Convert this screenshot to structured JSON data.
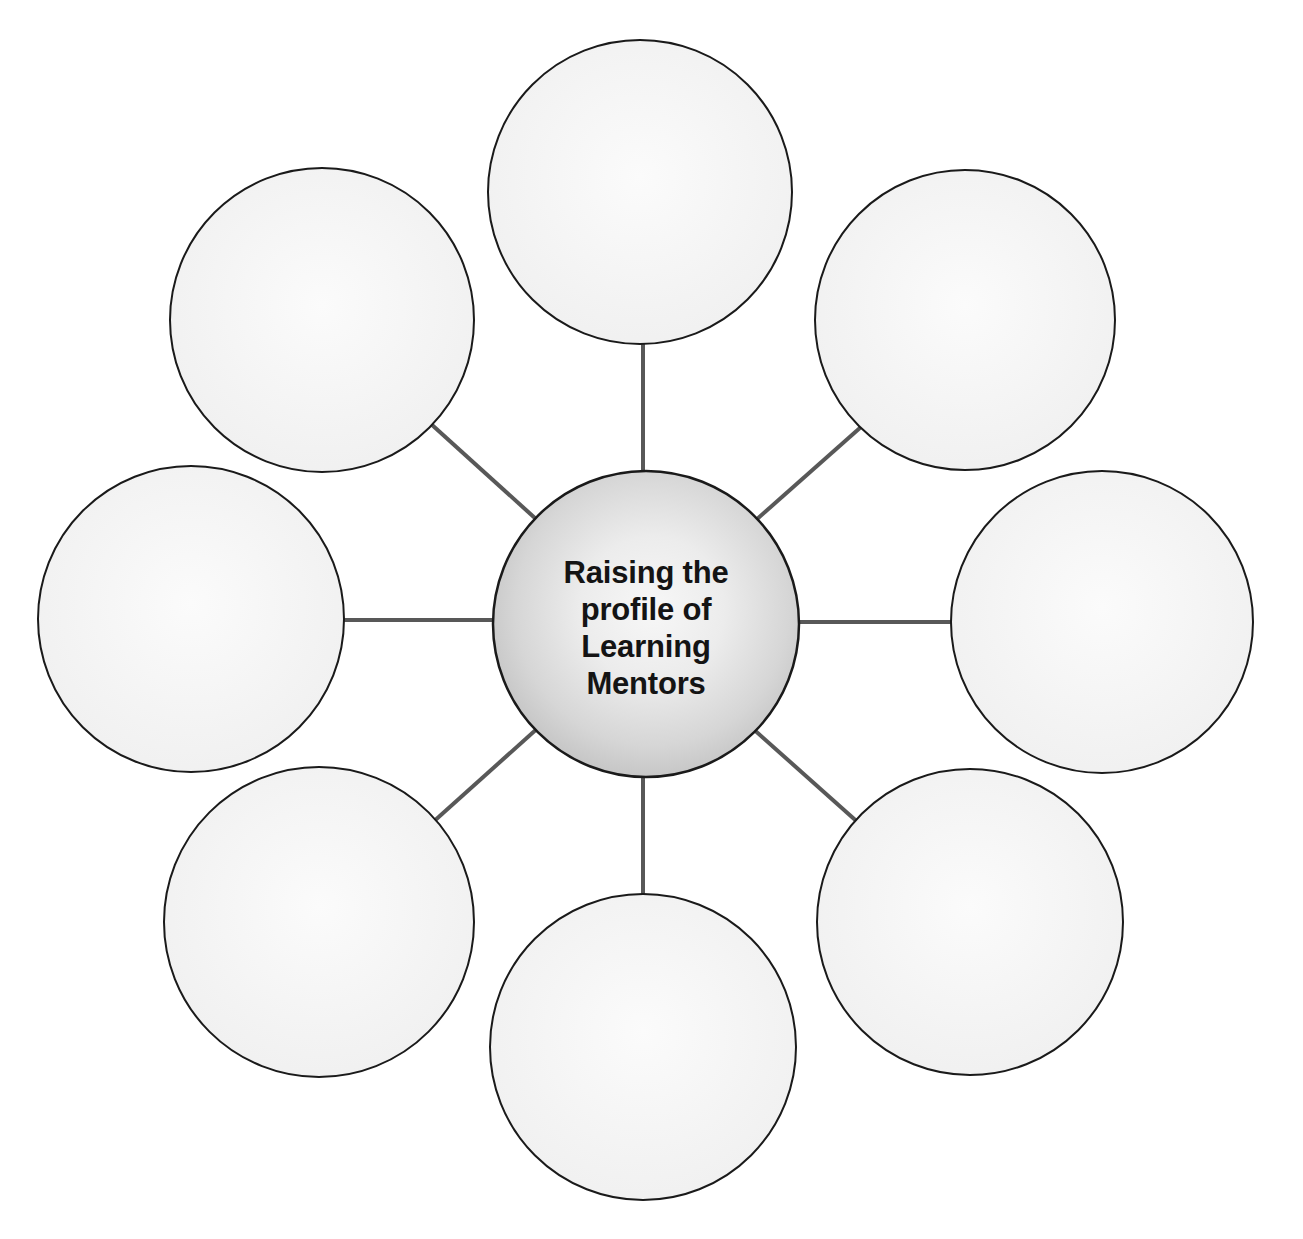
{
  "document": {
    "type": "spider-web-graphic-organizer",
    "title": "Raising the profile of Learning Mentors",
    "background_color": "#ffffff"
  },
  "center_node": {
    "id": "center",
    "label_lines": [
      "Raising the",
      "profile of",
      "Learning",
      "Mentors"
    ],
    "label_full": "Raising the profile of Learning Mentors",
    "cx": 646,
    "cy": 624,
    "r": 153,
    "fill_center_color": "#f5f5f5",
    "fill_edge_color": "#bdbdbd",
    "stroke_color": "#1a1a1a",
    "stroke_width": 2.5,
    "text_color": "#141414",
    "text_bold": true
  },
  "satellite_nodes": [
    {
      "id": "node-top",
      "position": "top",
      "label": "",
      "cx": 640,
      "cy": 192,
      "r": 152,
      "fill_color": "#f4f4f4",
      "stroke_color": "#1a1a1a",
      "stroke_width": 2
    },
    {
      "id": "node-top-right",
      "position": "top-right",
      "label": "",
      "cx": 965,
      "cy": 320,
      "r": 150,
      "fill_color": "#f4f4f4",
      "stroke_color": "#1a1a1a",
      "stroke_width": 2
    },
    {
      "id": "node-right",
      "position": "right",
      "label": "",
      "cx": 1102,
      "cy": 622,
      "r": 151,
      "fill_color": "#f4f4f4",
      "stroke_color": "#1a1a1a",
      "stroke_width": 2
    },
    {
      "id": "node-bottom-right",
      "position": "bottom-right",
      "label": "",
      "cx": 970,
      "cy": 922,
      "r": 153,
      "fill_color": "#f4f4f4",
      "stroke_color": "#1a1a1a",
      "stroke_width": 2
    },
    {
      "id": "node-bottom",
      "position": "bottom",
      "label": "",
      "cx": 643,
      "cy": 1047,
      "r": 153,
      "fill_color": "#f4f4f4",
      "stroke_color": "#1a1a1a",
      "stroke_width": 2
    },
    {
      "id": "node-bottom-left",
      "position": "bottom-left",
      "label": "",
      "cx": 319,
      "cy": 922,
      "r": 155,
      "fill_color": "#f4f4f4",
      "stroke_color": "#1a1a1a",
      "stroke_width": 2
    },
    {
      "id": "node-left",
      "position": "left",
      "label": "",
      "cx": 191,
      "cy": 619,
      "r": 153,
      "fill_color": "#f4f4f4",
      "stroke_color": "#1a1a1a",
      "stroke_width": 2
    },
    {
      "id": "node-top-left",
      "position": "top-left",
      "label": "",
      "cx": 322,
      "cy": 320,
      "r": 152,
      "fill_color": "#f4f4f4",
      "stroke_color": "#1a1a1a",
      "stroke_width": 2
    }
  ],
  "connectors": {
    "stroke_color": "#585858",
    "stroke_width": 4,
    "lines": [
      {
        "id": "connector-top",
        "from": "center",
        "to": "node-top",
        "x1": 643,
        "y1": 471,
        "x2": 643,
        "y2": 344
      },
      {
        "id": "connector-top-right",
        "from": "center",
        "to": "node-top-right",
        "x1": 756,
        "y1": 520,
        "x2": 861,
        "y2": 427
      },
      {
        "id": "connector-right",
        "from": "center",
        "to": "node-right",
        "x1": 799,
        "y1": 622,
        "x2": 951,
        "y2": 622
      },
      {
        "id": "connector-bottom-right",
        "from": "center",
        "to": "node-bottom-right",
        "x1": 751,
        "y1": 727,
        "x2": 862,
        "y2": 826
      },
      {
        "id": "connector-bottom",
        "from": "center",
        "to": "node-bottom",
        "x1": 643,
        "y1": 777,
        "x2": 643,
        "y2": 894
      },
      {
        "id": "connector-bottom-left",
        "from": "center",
        "to": "node-bottom-left",
        "x1": 539,
        "y1": 727,
        "x2": 432,
        "y2": 823
      },
      {
        "id": "connector-left",
        "from": "center",
        "to": "node-left",
        "x1": 493,
        "y1": 620,
        "x2": 344,
        "y2": 620
      },
      {
        "id": "connector-top-left",
        "from": "center",
        "to": "node-top-left",
        "x1": 536,
        "y1": 519,
        "x2": 431,
        "y2": 424
      }
    ]
  }
}
